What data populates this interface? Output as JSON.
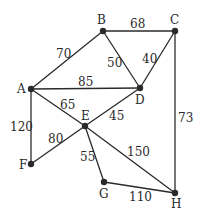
{
  "graph": {
    "nodes": [
      {
        "id": "A",
        "label": "A",
        "x": 31,
        "y": 89,
        "lx": 17,
        "ly": 93
      },
      {
        "id": "B",
        "label": "B",
        "x": 103,
        "y": 31,
        "lx": 97,
        "ly": 24
      },
      {
        "id": "C",
        "label": "C",
        "x": 175,
        "y": 31,
        "lx": 170,
        "ly": 24
      },
      {
        "id": "D",
        "label": "D",
        "x": 140,
        "y": 88,
        "lx": 135,
        "ly": 104
      },
      {
        "id": "E",
        "label": "E",
        "x": 85,
        "y": 126,
        "lx": 81,
        "ly": 120
      },
      {
        "id": "F",
        "label": "F",
        "x": 31,
        "y": 164,
        "lx": 19,
        "ly": 169
      },
      {
        "id": "G",
        "label": "G",
        "x": 104,
        "y": 182,
        "lx": 99,
        "ly": 198
      },
      {
        "id": "H",
        "label": "H",
        "x": 175,
        "y": 193,
        "lx": 171,
        "ly": 208
      }
    ],
    "edges": [
      {
        "from": "A",
        "to": "B",
        "weight": "70",
        "lx": 56,
        "ly": 58
      },
      {
        "from": "B",
        "to": "C",
        "weight": "68",
        "lx": 130,
        "ly": 28
      },
      {
        "from": "B",
        "to": "D",
        "weight": "50",
        "lx": 107,
        "ly": 67
      },
      {
        "from": "C",
        "to": "D",
        "weight": "40",
        "lx": 142,
        "ly": 63
      },
      {
        "from": "A",
        "to": "D",
        "weight": "85",
        "lx": 78,
        "ly": 86
      },
      {
        "from": "A",
        "to": "E",
        "weight": "65",
        "lx": 60,
        "ly": 109
      },
      {
        "from": "D",
        "to": "E",
        "weight": "45",
        "lx": 109,
        "ly": 120
      },
      {
        "from": "A",
        "to": "F",
        "weight": "120",
        "lx": 10,
        "ly": 131
      },
      {
        "from": "E",
        "to": "F",
        "weight": "80",
        "lx": 48,
        "ly": 143
      },
      {
        "from": "E",
        "to": "G",
        "weight": "55",
        "lx": 80,
        "ly": 161
      },
      {
        "from": "E",
        "to": "H",
        "weight": "150",
        "lx": 127,
        "ly": 156
      },
      {
        "from": "C",
        "to": "H",
        "weight": "73",
        "lx": 178,
        "ly": 122
      },
      {
        "from": "G",
        "to": "H",
        "weight": "110",
        "lx": 129,
        "ly": 201
      }
    ]
  }
}
